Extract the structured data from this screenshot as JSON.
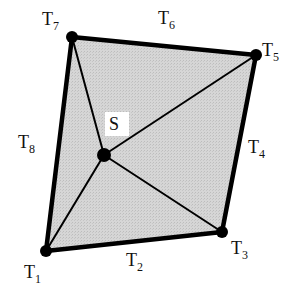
{
  "diagram": {
    "type": "quadrilateral-star-triangulation",
    "fill_color": "#d4d4d4",
    "stroke_color": "#000000",
    "vertices": [
      {
        "id": "T1",
        "label": "T",
        "sub": "1",
        "x": 46,
        "y": 251,
        "lx": 24,
        "ly": 278
      },
      {
        "id": "T3",
        "label": "T",
        "sub": "3",
        "x": 222,
        "y": 232,
        "lx": 231,
        "ly": 254
      },
      {
        "id": "T5",
        "label": "T",
        "sub": "5",
        "x": 256,
        "y": 55,
        "lx": 262,
        "ly": 56
      },
      {
        "id": "T7",
        "label": "T",
        "sub": "7",
        "x": 72,
        "y": 37,
        "lx": 42,
        "ly": 25
      }
    ],
    "center": {
      "id": "S",
      "label": "S",
      "x": 104,
      "y": 155,
      "lx": 109,
      "ly": 130
    },
    "edges": [
      {
        "id": "T2",
        "label": "T",
        "sub": "2",
        "lx": 126,
        "ly": 266
      },
      {
        "id": "T4",
        "label": "T",
        "sub": "4",
        "lx": 248,
        "ly": 153
      },
      {
        "id": "T6",
        "label": "T",
        "sub": "6",
        "lx": 158,
        "ly": 24
      },
      {
        "id": "T8",
        "label": "T",
        "sub": "8",
        "lx": 18,
        "ly": 148
      }
    ]
  }
}
